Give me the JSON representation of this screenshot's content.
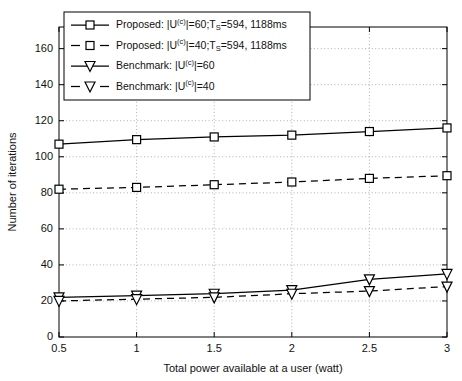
{
  "chart_data": {
    "type": "line",
    "title": "",
    "xlabel": "Total power available at a user (watt)",
    "ylabel": "Number of iterations",
    "x": [
      0.5,
      1,
      1.5,
      2,
      2.5,
      3
    ],
    "xticklabels": [
      "0.5",
      "1",
      "1.5",
      "2",
      "2.5",
      "3"
    ],
    "yticks": [
      0,
      20,
      40,
      60,
      80,
      100,
      120,
      140,
      160
    ],
    "yticklabels": [
      "0",
      "20",
      "40",
      "60",
      "80",
      "100",
      "120",
      "140",
      "160"
    ],
    "xlim": [
      0.5,
      3
    ],
    "ylim": [
      0,
      172
    ],
    "grid": true,
    "legend_position": "upper-left",
    "series": [
      {
        "name": "Proposed: |U(c)|=60;TS=594, 1188ms",
        "legend_label_parts": {
          "prefix": "Proposed: |U",
          "sup": "(c)",
          "mid": "|=60;T",
          "sub": "S",
          "suffix": "=594, 1188ms"
        },
        "marker": "square",
        "linestyle": "solid",
        "values": [
          107,
          109.5,
          111,
          112,
          114,
          116
        ]
      },
      {
        "name": "Proposed: |U(c)|=40;TS=594, 1188ms",
        "legend_label_parts": {
          "prefix": "Proposed: |U",
          "sup": "(c)",
          "mid": "|=40;T",
          "sub": "S",
          "suffix": "=594, 1188ms"
        },
        "marker": "square",
        "linestyle": "dashed",
        "values": [
          82,
          83,
          84.5,
          86,
          88,
          89.5
        ]
      },
      {
        "name": "Benchmark: |U(c)|=60",
        "legend_label_parts": {
          "prefix": "Benchmark: |U",
          "sup": "(c)",
          "mid": "|=60",
          "sub": "",
          "suffix": ""
        },
        "marker": "triangle-down",
        "linestyle": "solid",
        "values": [
          22,
          23,
          24,
          26,
          32,
          35
        ]
      },
      {
        "name": "Benchmark: |U(c)|=40",
        "legend_label_parts": {
          "prefix": "Benchmark: |U",
          "sup": "(c)",
          "mid": "|=40",
          "sub": "",
          "suffix": ""
        },
        "marker": "triangle-down",
        "linestyle": "dashed",
        "values": [
          20,
          21,
          22,
          24,
          25.5,
          28
        ]
      }
    ],
    "colors": {
      "line": "#000000",
      "grid": "#9a9a9a",
      "background": "#ffffff"
    }
  }
}
